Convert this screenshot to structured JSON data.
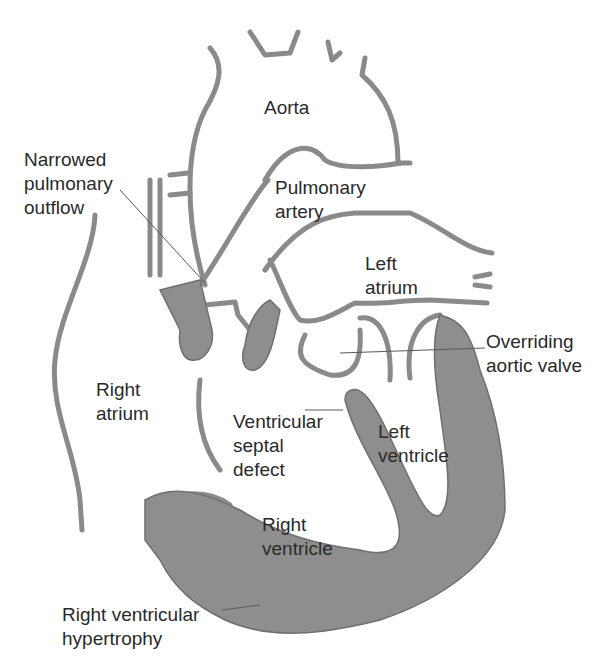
{
  "colors": {
    "wall": "#8e8e8e",
    "outline": "#6f6f6f",
    "text": "#2a2a2a",
    "background": "#ffffff"
  },
  "labels": {
    "aorta": "Aorta",
    "narrowed_pulmonary_outflow": "Narrowed\npulmonary\noutflow",
    "pulmonary_artery": "Pulmonary\nartery",
    "left_atrium": "Left\natrium",
    "overriding_aortic_valve": "Overriding\naortic valve",
    "right_atrium": "Right\natrium",
    "ventricular_septal_defect": "Ventricular\nseptal\ndefect",
    "left_ventricle": "Left\nventricle",
    "right_ventricle": "Right\nventricle",
    "right_ventricular_hypertrophy": "Right ventricular\nhypertrophy"
  }
}
